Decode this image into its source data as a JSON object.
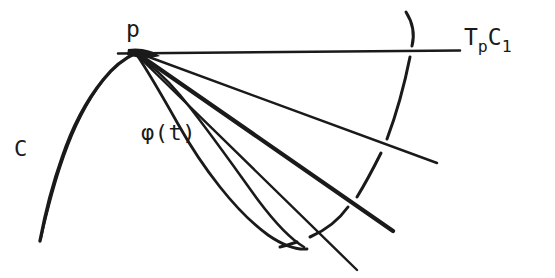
{
  "figure": {
    "type": "hand-drawn mathematical diagram",
    "background_color": "#ffffff",
    "ink_color": "#1a1a1a",
    "width": 555,
    "height": 278,
    "labels": {
      "point_p": "p",
      "curve_C": "C",
      "parametrization": "φ(t)",
      "tangent_cone_main": "T",
      "tangent_cone_sub1": "p",
      "tangent_cone_mid": "C",
      "tangent_cone_sub2": "1",
      "tangent_cone_full": "TₚC₁"
    },
    "elements": [
      {
        "name": "curve-C",
        "description": "Smooth curve C ascending from lower-left to the point p",
        "path": "M 40 240 C 46 210, 58 160, 78 118 C 96 80, 114 60, 135 52"
      },
      {
        "name": "tangent-line",
        "description": "Horizontal tangent line T_p C_1 through p",
        "path": "M 118 53 L 460 50"
      },
      {
        "name": "secant-line-1",
        "description": "Uppermost secant ray from p",
        "path": "M 137 53 L 437 163"
      },
      {
        "name": "secant-line-2",
        "description": "Second secant ray from p, thicker",
        "path": "M 137 54 L 393 231"
      },
      {
        "name": "secant-line-3",
        "description": "Third secant ray from p, thin, extending past bottom",
        "path": "M 136 55 L 357 270"
      },
      {
        "name": "curve-phi",
        "description": "Curve phi(t) leaving p and bending down-right to a cusp",
        "path": "M 136 55 C 150 72, 170 104, 196 150 C 226 204, 268 244, 305 249"
      },
      {
        "name": "curve-phi-inner",
        "description": "Inner branch of phi(t) returning toward p",
        "path": "M 136 56 C 152 66, 172 86, 196 118 C 228 160, 266 210, 302 247"
      },
      {
        "name": "arc-dash-top",
        "description": "Dashed circular arc fragment above the tangent line",
        "path": "M 407 12 C 414 24, 415 36, 412 46"
      },
      {
        "name": "arc-dash-upper",
        "description": "Dashed circular arc fragment below the tangent line",
        "path": "M 410 56 C 404 86, 396 114, 387 139"
      },
      {
        "name": "arc-dash-middle",
        "description": "Dashed circular arc fragment crossing secant lines",
        "path": "M 380 154 C 372 170, 364 185, 356 198"
      },
      {
        "name": "arc-dash-lower",
        "description": "Dashed circular arc fragment near bottom",
        "path": "M 347 208 C 336 222, 322 232, 308 238"
      },
      {
        "name": "arc-dash-bottom",
        "description": "Lowest dashed circular arc fragment",
        "path": "M 296 243 C 290 245, 284 247, 279 248"
      }
    ]
  }
}
